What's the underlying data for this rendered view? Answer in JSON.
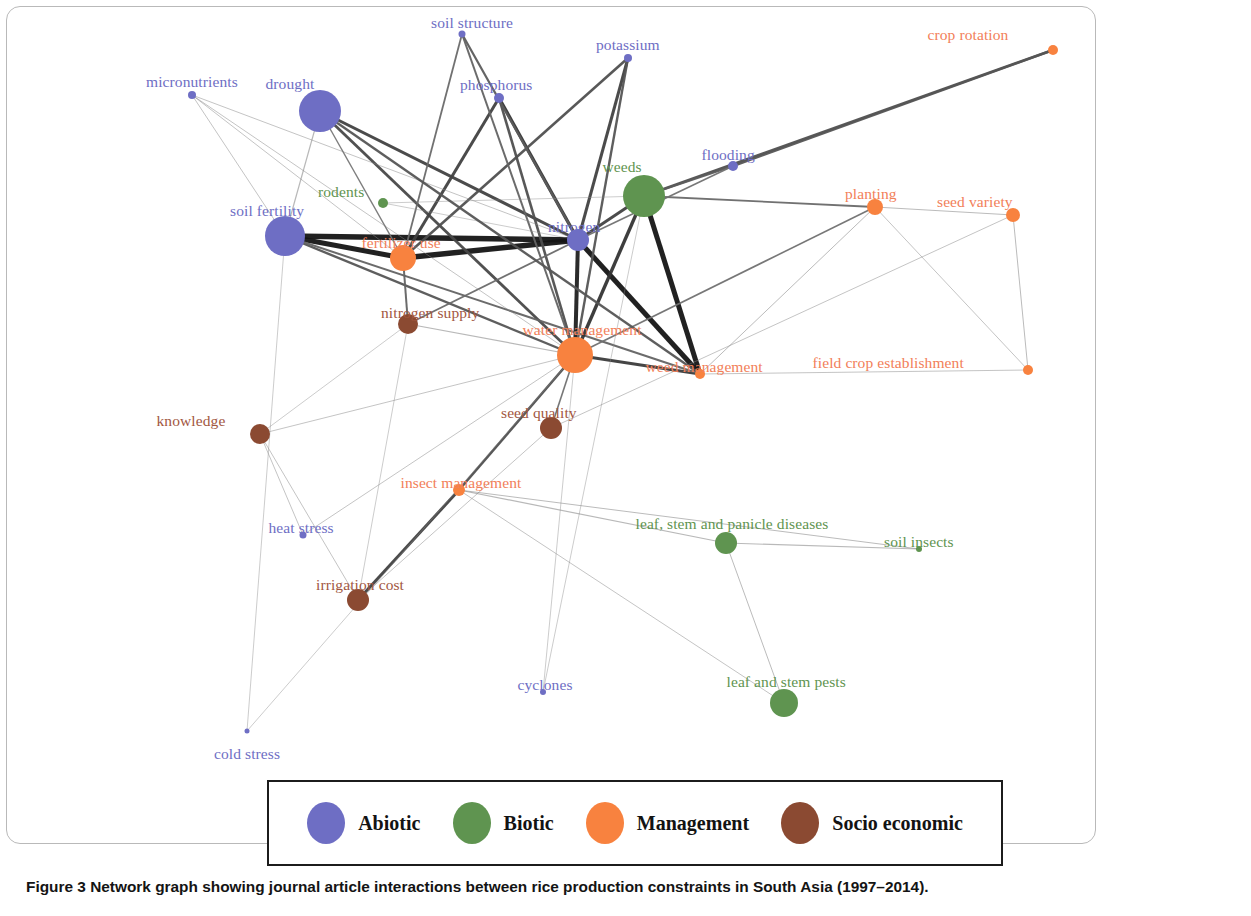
{
  "figure": {
    "caption_label": "Figure 3",
    "caption_text": "Network graph showing journal article interactions between rice production constraints in South Asia (1997–2014)."
  },
  "legend": {
    "items": [
      {
        "label": "Abiotic",
        "color": "#6e6ec4"
      },
      {
        "label": "Biotic",
        "color": "#5f9450"
      },
      {
        "label": "Management",
        "color": "#f8823f"
      },
      {
        "label": "Socio economic",
        "color": "#8b4a32"
      }
    ]
  },
  "chart_data": {
    "type": "scatter",
    "title": "Network graph showing journal article interactions between rice production constraints in South Asia (1997–2014).",
    "xlabel": "",
    "ylabel": "",
    "grid": false,
    "legend_position": "bottom",
    "categories": [
      "Abiotic",
      "Biotic",
      "Management",
      "Socio economic"
    ],
    "category_colors": {
      "Abiotic": "#6e6ec4",
      "Biotic": "#5f9450",
      "Management": "#f8823f",
      "Socio economic": "#8b4a32"
    },
    "nodes": [
      {
        "id": "soil_structure",
        "label": "soil structure",
        "category": "Abiotic",
        "x": 462,
        "y": 34,
        "r": 3.5,
        "label_dx": 10,
        "label_dy": -20
      },
      {
        "id": "potassium",
        "label": "potassium",
        "category": "Abiotic",
        "x": 628,
        "y": 58,
        "r": 4,
        "label_dx": 0,
        "label_dy": -22
      },
      {
        "id": "crop_rotation",
        "label": "crop rotation",
        "category": "Management",
        "x": 1053,
        "y": 50,
        "r": 5,
        "label_dx": -85,
        "label_dy": -24
      },
      {
        "id": "micronutrients",
        "label": "micronutrients",
        "category": "Abiotic",
        "x": 192,
        "y": 95,
        "r": 4,
        "label_dx": 0,
        "label_dy": -22
      },
      {
        "id": "drought",
        "label": "drought",
        "category": "Abiotic",
        "x": 320,
        "y": 111,
        "r": 21,
        "label_dx": -30,
        "label_dy": -36
      },
      {
        "id": "phosphorus",
        "label": "phosphorus",
        "category": "Abiotic",
        "x": 499,
        "y": 98,
        "r": 5,
        "label_dx": -3,
        "label_dy": -22
      },
      {
        "id": "flooding",
        "label": "flooding",
        "category": "Abiotic",
        "x": 733,
        "y": 166,
        "r": 5,
        "label_dx": -5,
        "label_dy": -20
      },
      {
        "id": "weeds",
        "label": "weeds",
        "category": "Biotic",
        "x": 644,
        "y": 196,
        "r": 21,
        "label_dx": -22,
        "label_dy": -38
      },
      {
        "id": "planting",
        "label": "planting",
        "category": "Management",
        "x": 875,
        "y": 207,
        "r": 8,
        "label_dx": -4,
        "label_dy": -22
      },
      {
        "id": "seed_variety",
        "label": "seed variety",
        "category": "Management",
        "x": 1013,
        "y": 215,
        "r": 7,
        "label_dx": -38,
        "label_dy": -22
      },
      {
        "id": "rodents",
        "label": "rodents",
        "category": "Biotic",
        "x": 383,
        "y": 203,
        "r": 5,
        "label_dx": -42,
        "label_dy": -20
      },
      {
        "id": "soil_fertility",
        "label": "soil fertility",
        "category": "Abiotic",
        "x": 285,
        "y": 236,
        "r": 20,
        "label_dx": -18,
        "label_dy": -34
      },
      {
        "id": "nitrogen",
        "label": "nitrogen",
        "category": "Abiotic",
        "x": 578,
        "y": 240,
        "r": 11,
        "label_dx": -4,
        "label_dy": -22
      },
      {
        "id": "fertilizer_use",
        "label": "fertilizer use",
        "category": "Management",
        "x": 403,
        "y": 258,
        "r": 13,
        "label_dx": -2,
        "label_dy": -24
      },
      {
        "id": "nitrogen_supply",
        "label": "nitrogen supply",
        "category": "Socio economic",
        "x": 408,
        "y": 324,
        "r": 10,
        "label_dx": 22,
        "label_dy": -20
      },
      {
        "id": "water_management",
        "label": "water management",
        "category": "Management",
        "x": 575,
        "y": 355,
        "r": 18,
        "label_dx": 7,
        "label_dy": -34
      },
      {
        "id": "weed_management",
        "label": "weed management",
        "category": "Management",
        "x": 700,
        "y": 374,
        "r": 5,
        "label_dx": 4,
        "label_dy": -16
      },
      {
        "id": "field_crop_establishment",
        "label": "field crop establishment",
        "category": "Management",
        "x": 1028,
        "y": 370,
        "r": 5,
        "label_dx": -140,
        "label_dy": -16
      },
      {
        "id": "seed_quality",
        "label": "seed quality",
        "category": "Socio economic",
        "x": 551,
        "y": 428,
        "r": 11,
        "label_dx": -12,
        "label_dy": -24
      },
      {
        "id": "knowledge",
        "label": "knowledge",
        "category": "Socio economic",
        "x": 260,
        "y": 434,
        "r": 10,
        "label_dx": -69,
        "label_dy": -22
      },
      {
        "id": "insect_management",
        "label": "insect management",
        "category": "Management",
        "x": 459,
        "y": 490,
        "r": 6,
        "label_dx": 2,
        "label_dy": -16
      },
      {
        "id": "heat_stress",
        "label": "heat stress",
        "category": "Abiotic",
        "x": 303,
        "y": 535,
        "r": 3.5,
        "label_dx": -2,
        "label_dy": -16
      },
      {
        "id": "leaf_stem_panicle_diseases",
        "label": "leaf, stem and panicle diseases",
        "category": "Biotic",
        "x": 726,
        "y": 543,
        "r": 11,
        "label_dx": 6,
        "label_dy": -28
      },
      {
        "id": "soil_insects",
        "label": "soil insects",
        "category": "Biotic",
        "x": 919,
        "y": 549,
        "r": 3,
        "label_dx": 0,
        "label_dy": -16
      },
      {
        "id": "irrigation_cost",
        "label": "irrigation cost",
        "category": "Socio economic",
        "x": 358,
        "y": 600,
        "r": 11,
        "label_dx": 2,
        "label_dy": -24
      },
      {
        "id": "cyclones",
        "label": "cyclones",
        "category": "Abiotic",
        "x": 543,
        "y": 692,
        "r": 3,
        "label_dx": 2,
        "label_dy": -16
      },
      {
        "id": "leaf_and_stem_pests",
        "label": "leaf and stem pests",
        "category": "Biotic",
        "x": 784,
        "y": 703,
        "r": 14,
        "label_dx": 2,
        "label_dy": -30
      },
      {
        "id": "cold_stress",
        "label": "cold stress",
        "category": "Abiotic",
        "x": 247,
        "y": 731,
        "r": 2.5,
        "label_dx": 0,
        "label_dy": 14
      }
    ],
    "edges": [
      {
        "source": "soil_fertility",
        "target": "nitrogen",
        "weight": 5.5
      },
      {
        "source": "soil_fertility",
        "target": "fertilizer_use",
        "weight": 5.0
      },
      {
        "source": "fertilizer_use",
        "target": "nitrogen",
        "weight": 5.5
      },
      {
        "source": "nitrogen",
        "target": "water_management",
        "weight": 4.0
      },
      {
        "source": "nitrogen",
        "target": "weed_management",
        "weight": 5.0
      },
      {
        "source": "weeds",
        "target": "weed_management",
        "weight": 5.0
      },
      {
        "source": "water_management",
        "target": "weed_management",
        "weight": 3.2
      },
      {
        "source": "crop_rotation",
        "target": "weeds",
        "weight": 2.6
      },
      {
        "source": "crop_rotation",
        "target": "flooding",
        "weight": 2.4
      },
      {
        "source": "drought",
        "target": "nitrogen",
        "weight": 3.0
      },
      {
        "source": "drought",
        "target": "water_management",
        "weight": 2.8
      },
      {
        "source": "phosphorus",
        "target": "nitrogen",
        "weight": 3.4
      },
      {
        "source": "phosphorus",
        "target": "fertilizer_use",
        "weight": 3.0
      },
      {
        "source": "phosphorus",
        "target": "water_management",
        "weight": 2.6
      },
      {
        "source": "potassium",
        "target": "nitrogen",
        "weight": 3.0
      },
      {
        "source": "potassium",
        "target": "fertilizer_use",
        "weight": 2.6
      },
      {
        "source": "potassium",
        "target": "water_management",
        "weight": 2.4
      },
      {
        "source": "soil_structure",
        "target": "nitrogen",
        "weight": 2.2
      },
      {
        "source": "soil_structure",
        "target": "water_management",
        "weight": 2.0
      },
      {
        "source": "soil_structure",
        "target": "fertilizer_use",
        "weight": 1.8
      },
      {
        "source": "soil_fertility",
        "target": "water_management",
        "weight": 2.4
      },
      {
        "source": "soil_fertility",
        "target": "weed_management",
        "weight": 2.0
      },
      {
        "source": "nitrogen_supply",
        "target": "fertilizer_use",
        "weight": 2.0
      },
      {
        "source": "nitrogen_supply",
        "target": "nitrogen",
        "weight": 1.8
      },
      {
        "source": "water_management",
        "target": "planting",
        "weight": 1.6
      },
      {
        "source": "weeds",
        "target": "planting",
        "weight": 1.8
      },
      {
        "source": "weeds",
        "target": "nitrogen",
        "weight": 3.0
      },
      {
        "source": "weeds",
        "target": "water_management",
        "weight": 3.4
      },
      {
        "source": "irrigation_cost",
        "target": "insect_management",
        "weight": 3.0
      },
      {
        "source": "insect_management",
        "target": "water_management",
        "weight": 2.6
      },
      {
        "source": "flooding",
        "target": "weeds",
        "weight": 2.2
      },
      {
        "source": "flooding",
        "target": "nitrogen",
        "weight": 1.6
      },
      {
        "source": "seed_quality",
        "target": "water_management",
        "weight": 1.6
      },
      {
        "source": "seed_variety",
        "target": "planting",
        "weight": 1.0
      },
      {
        "source": "seed_variety",
        "target": "field_crop_establishment",
        "weight": 1.0
      },
      {
        "source": "weed_management",
        "target": "field_crop_establishment",
        "weight": 0.9
      },
      {
        "source": "leaf_stem_panicle_diseases",
        "target": "soil_insects",
        "weight": 1.1
      },
      {
        "source": "leaf_stem_panicle_diseases",
        "target": "leaf_and_stem_pests",
        "weight": 1.0
      },
      {
        "source": "insect_management",
        "target": "leaf_stem_panicle_diseases",
        "weight": 1.2
      },
      {
        "source": "insect_management",
        "target": "soil_insects",
        "weight": 1.0
      },
      {
        "source": "knowledge",
        "target": "heat_stress",
        "weight": 0.9
      },
      {
        "source": "knowledge",
        "target": "irrigation_cost",
        "weight": 0.9
      },
      {
        "source": "knowledge",
        "target": "water_management",
        "weight": 0.9
      },
      {
        "source": "heat_stress",
        "target": "water_management",
        "weight": 0.9
      },
      {
        "source": "cold_stress",
        "target": "water_management",
        "weight": 0.8
      },
      {
        "source": "cold_stress",
        "target": "soil_fertility",
        "weight": 0.8
      },
      {
        "source": "cyclones",
        "target": "water_management",
        "weight": 0.8
      },
      {
        "source": "cyclones",
        "target": "weeds",
        "weight": 0.8
      },
      {
        "source": "micronutrients",
        "target": "soil_fertility",
        "weight": 0.9
      },
      {
        "source": "micronutrients",
        "target": "fertilizer_use",
        "weight": 0.9
      },
      {
        "source": "micronutrients",
        "target": "nitrogen",
        "weight": 0.9
      },
      {
        "source": "micronutrients",
        "target": "water_management",
        "weight": 0.9
      },
      {
        "source": "rodents",
        "target": "weeds",
        "weight": 0.8
      },
      {
        "source": "rodents",
        "target": "nitrogen",
        "weight": 0.8
      },
      {
        "source": "planting",
        "target": "weed_management",
        "weight": 1.0
      },
      {
        "source": "planting",
        "target": "field_crop_establishment",
        "weight": 0.9
      },
      {
        "source": "seed_quality",
        "target": "seed_variety",
        "weight": 0.9
      },
      {
        "source": "seed_quality",
        "target": "irrigation_cost",
        "weight": 0.9
      },
      {
        "source": "leaf_and_stem_pests",
        "target": "insect_management",
        "weight": 0.9
      },
      {
        "source": "drought",
        "target": "soil_fertility",
        "weight": 1.2
      },
      {
        "source": "drought",
        "target": "weed_management",
        "weight": 2.4
      },
      {
        "source": "drought",
        "target": "fertilizer_use",
        "weight": 1.4
      },
      {
        "source": "nitrogen_supply",
        "target": "water_management",
        "weight": 1.2
      },
      {
        "source": "nitrogen_supply",
        "target": "knowledge",
        "weight": 0.8
      },
      {
        "source": "nitrogen_supply",
        "target": "irrigation_cost",
        "weight": 0.8
      }
    ]
  }
}
